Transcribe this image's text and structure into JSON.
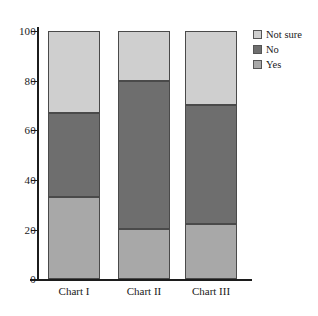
{
  "chart_data": {
    "type": "bar",
    "subtype": "stacked-bar-100",
    "title": "",
    "xlabel": "",
    "ylabel": "",
    "categories": [
      "Chart I",
      "Chart II",
      "Chart III"
    ],
    "series": [
      {
        "name": "Yes",
        "color": "#a8a8a8",
        "values": [
          33,
          20,
          22
        ]
      },
      {
        "name": "No",
        "color": "#6e6e6e",
        "values": [
          34,
          60,
          48
        ]
      },
      {
        "name": "Not sure",
        "color": "#cfcfcf",
        "values": [
          33,
          20,
          30
        ]
      }
    ],
    "stack_tops": {
      "Chart I": {
        "Yes": 33,
        "No": 67,
        "Not sure": 100
      },
      "Chart II": {
        "Yes": 20,
        "No": 80,
        "Not sure": 100
      },
      "Chart III": {
        "Yes": 22,
        "No": 70,
        "Not sure": 100
      }
    },
    "ylim": [
      0,
      100
    ],
    "ytick_labels": [
      "0",
      "20",
      "40",
      "60",
      "80",
      "100"
    ],
    "ytick_values": [
      0,
      20,
      40,
      60,
      80,
      100
    ],
    "grid": false,
    "legend_position": "right-top",
    "legend_order": [
      "Not sure",
      "No",
      "Yes"
    ]
  },
  "axes": {
    "y_ticks": [
      {
        "label": "100",
        "value": 100
      },
      {
        "label": "80",
        "value": 80
      },
      {
        "label": "60",
        "value": 60
      },
      {
        "label": "40",
        "value": 40
      },
      {
        "label": "20",
        "value": 20
      },
      {
        "label": "0",
        "value": 0
      }
    ],
    "x_categories": [
      {
        "label": "Chart I"
      },
      {
        "label": "Chart II"
      },
      {
        "label": "Chart III"
      }
    ]
  },
  "legend": {
    "items": [
      {
        "label": "Not sure",
        "color": "#cfcfcf"
      },
      {
        "label": "No",
        "color": "#6e6e6e"
      },
      {
        "label": "Yes",
        "color": "#a8a8a8"
      }
    ]
  },
  "colors": {
    "not_sure": "#cfcfcf",
    "no": "#6e6e6e",
    "yes": "#a8a8a8",
    "axis": "#1c1c1c",
    "bar_border": "#4a4a4a",
    "background": "#ffffff"
  }
}
